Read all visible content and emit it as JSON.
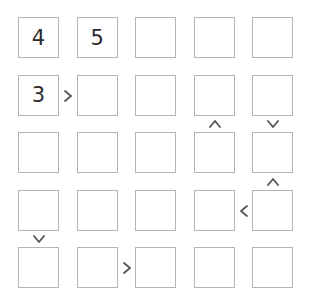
{
  "puzzle": {
    "type": "futoshiki",
    "size": 5,
    "grid": [
      [
        "4",
        "5",
        "",
        "",
        ""
      ],
      [
        "3",
        "",
        "",
        "",
        ""
      ],
      [
        "",
        "",
        "",
        "",
        ""
      ],
      [
        "",
        "",
        "",
        "",
        ""
      ],
      [
        "",
        "",
        "",
        "",
        ""
      ]
    ],
    "horizontal_signs": [
      {
        "row": 1,
        "between_cols": [
          0,
          1
        ],
        "symbol": ">"
      },
      {
        "row": 3,
        "between_cols": [
          3,
          4
        ],
        "symbol": "<"
      },
      {
        "row": 4,
        "between_cols": [
          1,
          2
        ],
        "symbol": ">"
      }
    ],
    "vertical_signs": [
      {
        "col": 3,
        "between_rows": [
          1,
          2
        ],
        "symbol": "^"
      },
      {
        "col": 4,
        "between_rows": [
          1,
          2
        ],
        "symbol": "v"
      },
      {
        "col": 4,
        "between_rows": [
          2,
          3
        ],
        "symbol": "^"
      },
      {
        "col": 0,
        "between_rows": [
          3,
          4
        ],
        "symbol": "v"
      }
    ]
  },
  "colors": {
    "cell_border": "#b4b4b4",
    "digit": "#2b2b2b",
    "sign": "#555555",
    "background": "#ffffff"
  }
}
